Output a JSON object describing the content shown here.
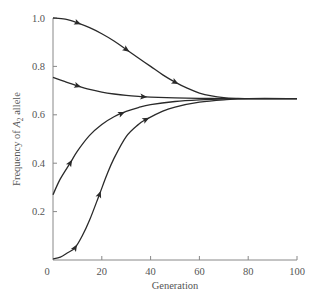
{
  "chart_data": {
    "type": "line",
    "title": "",
    "xlabel": "Generation",
    "ylabel": "Frequency of A2 allele",
    "ylabel_parts": {
      "pre": "Frequency of ",
      "sym": "A",
      "sub": "2",
      "post": " allele"
    },
    "xlim": [
      0,
      100
    ],
    "ylim": [
      0,
      1.0
    ],
    "xticks": [
      0,
      20,
      40,
      60,
      80,
      100
    ],
    "xtick_labels": [
      "0",
      "20",
      "40",
      "60",
      "80",
      "100"
    ],
    "yticks": [
      0.2,
      0.4,
      0.6,
      0.8,
      1.0
    ],
    "ytick_labels": [
      "0.2",
      "0.4",
      "0.6",
      "0.8",
      "1.0"
    ],
    "grid": false,
    "legend": null,
    "equilibrium": 0.667,
    "series": [
      {
        "name": "start 1.0",
        "x": [
          0,
          5,
          10,
          15,
          20,
          25,
          30,
          35,
          40,
          45,
          50,
          55,
          60,
          65,
          70,
          75,
          80,
          100
        ],
        "values": [
          1.0,
          0.995,
          0.98,
          0.96,
          0.935,
          0.905,
          0.87,
          0.835,
          0.8,
          0.765,
          0.735,
          0.71,
          0.69,
          0.678,
          0.671,
          0.668,
          0.667,
          0.667
        ],
        "arrows_at": [
          10,
          30,
          50
        ]
      },
      {
        "name": "start 0.755",
        "x": [
          0,
          5,
          10,
          15,
          20,
          25,
          30,
          35,
          40,
          50,
          60,
          70,
          80,
          100
        ],
        "values": [
          0.755,
          0.737,
          0.72,
          0.705,
          0.694,
          0.686,
          0.68,
          0.676,
          0.673,
          0.67,
          0.668,
          0.667,
          0.667,
          0.667
        ],
        "arrows_at": [
          10,
          37
        ]
      },
      {
        "name": "start 0.27",
        "x": [
          0,
          3,
          7,
          10,
          15,
          20,
          25,
          30,
          35,
          40,
          50,
          60,
          70,
          80,
          100
        ],
        "values": [
          0.27,
          0.335,
          0.4,
          0.45,
          0.515,
          0.56,
          0.592,
          0.614,
          0.63,
          0.642,
          0.655,
          0.662,
          0.666,
          0.667,
          0.667
        ],
        "arrows_at": [
          7,
          28
        ]
      },
      {
        "name": "start 0.0",
        "x": [
          0,
          3,
          6,
          9,
          12,
          15,
          19,
          22,
          25,
          30,
          35,
          38,
          45,
          50,
          60,
          70,
          80,
          100
        ],
        "values": [
          0.005,
          0.012,
          0.03,
          0.05,
          0.1,
          0.165,
          0.27,
          0.35,
          0.42,
          0.51,
          0.56,
          0.58,
          0.615,
          0.632,
          0.652,
          0.662,
          0.667,
          0.667
        ],
        "arrows_at": [
          9,
          19,
          38
        ]
      }
    ]
  }
}
